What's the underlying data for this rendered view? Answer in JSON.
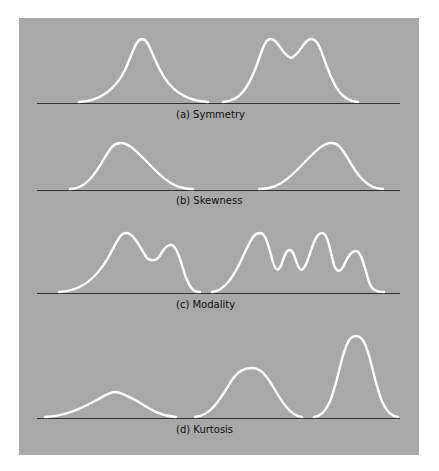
{
  "colors": {
    "panel": "#a8a8a8",
    "curve": "#ffffff",
    "axis": "#333333",
    "page": "#ffffff"
  },
  "panels": [
    {
      "id": "a",
      "caption": "(a) Symmetry",
      "curves": [
        "unimodal symmetric",
        "bimodal symmetric"
      ]
    },
    {
      "id": "b",
      "caption": "(b) Skewness",
      "curves": [
        "right (positive) skew",
        "left (negative) skew"
      ]
    },
    {
      "id": "c",
      "caption": "(c) Modality",
      "curves": [
        "bimodal",
        "multimodal"
      ]
    },
    {
      "id": "d",
      "caption": "(d) Kurtosis",
      "curves": [
        "platykurtic",
        "mesokurtic",
        "leptokurtic"
      ]
    }
  ]
}
